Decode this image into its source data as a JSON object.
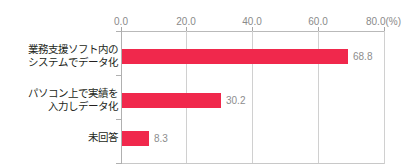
{
  "chart_data": {
    "type": "bar",
    "orientation": "horizontal",
    "title": "",
    "xlabel": "",
    "ylabel": "",
    "unit_note": "(%)",
    "xlim": [
      0,
      80
    ],
    "xtick_interval": 20,
    "grid": true,
    "legend": false,
    "axis_position": "top",
    "bar_color": "#f0284c",
    "categories": [
      "業務支援ソフト内のシステムでデータ化",
      "パソコン上で実績を入力しデータ化",
      "未回答"
    ],
    "values": [
      68.8,
      30.2,
      8.3
    ],
    "tick_labels": [
      "0.0",
      "20.0",
      "40.0",
      "60.0",
      "80.0"
    ]
  },
  "axis": {
    "ticks": [
      {
        "label": "0.0",
        "value": 0
      },
      {
        "label": "20.0",
        "value": 20
      },
      {
        "label": "40.0",
        "value": 40
      },
      {
        "label": "60.0",
        "value": 60
      },
      {
        "label": "80.0",
        "value": 80
      }
    ],
    "unit": "(%)"
  },
  "rows": [
    {
      "label_line1": "業務支援ソフト内の",
      "label_line2": "システムでデータ化",
      "value": 68.8,
      "value_label": "68.8"
    },
    {
      "label_line1": "パソコン上で実績を",
      "label_line2": "入力しデータ化",
      "value": 30.2,
      "value_label": "30.2"
    },
    {
      "label_line1": "未回答",
      "label_line2": "",
      "value": 8.3,
      "value_label": "8.3"
    }
  ]
}
